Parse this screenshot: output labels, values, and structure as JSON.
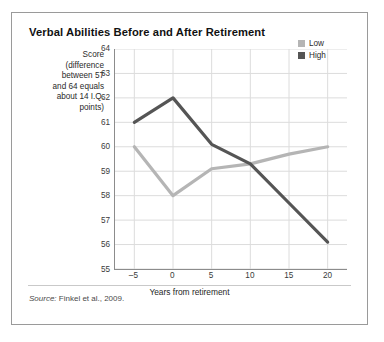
{
  "card": {
    "title": "Verbal Abilities Before and After Retirement",
    "source_prefix": "Source:",
    "source_text": "Finkel et al., 2009."
  },
  "legend": {
    "position": "top-right",
    "items": [
      {
        "label": "Low",
        "color": "#b5b5b5"
      },
      {
        "label": "High",
        "color": "#555555"
      }
    ]
  },
  "axes": {
    "ylabel_lines": [
      "Score",
      "(difference",
      "between 57",
      "and 64 equals",
      "about 14 I.Q.",
      "points)"
    ],
    "ylabel_full": "Score (difference between 57 and 64 equals about 14 I.Q. points)",
    "xlabel": "Years from retirement",
    "yticks": [
      "64",
      "63",
      "62",
      "61",
      "60",
      "59",
      "58",
      "57",
      "56",
      "55"
    ],
    "xticks": [
      "–5",
      "0",
      "5",
      "10",
      "15",
      "20"
    ]
  },
  "chart_data": {
    "type": "line",
    "title": "Verbal Abilities Before and After Retirement",
    "xlabel": "Years from retirement",
    "ylabel": "Score (difference between 57 and 64 equals about 14 I.Q. points)",
    "x": [
      -5,
      0,
      5,
      10,
      15,
      20
    ],
    "xlim": [
      -7.5,
      22.5
    ],
    "ylim": [
      55,
      64
    ],
    "grid": true,
    "legend_position": "top-right",
    "series": [
      {
        "name": "Low",
        "color": "#b5b5b5",
        "values": [
          60.0,
          58.0,
          59.1,
          59.3,
          59.7,
          60.0
        ]
      },
      {
        "name": "High",
        "color": "#555555",
        "values": [
          61.0,
          62.0,
          60.1,
          59.3,
          57.7,
          56.1
        ]
      }
    ]
  }
}
